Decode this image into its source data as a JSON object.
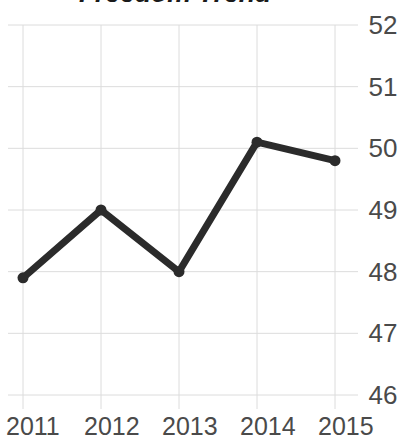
{
  "chart_data": {
    "type": "line",
    "title": "Freedom Trend",
    "xlabel": "",
    "ylabel": "",
    "categories": [
      "2011",
      "2012",
      "2013",
      "2014",
      "2015"
    ],
    "values": [
      47.9,
      49.0,
      48.0,
      50.1,
      49.8
    ],
    "series": [
      {
        "name": "Freedom",
        "values": [
          47.9,
          49.0,
          48.0,
          50.1,
          49.8
        ]
      }
    ],
    "ylim": [
      46,
      52
    ],
    "xlim": [
      "2011",
      "2015"
    ],
    "y_ticks": [
      "52",
      "51",
      "50",
      "49",
      "48",
      "47",
      "46"
    ],
    "y_tick_values": [
      52,
      51,
      50,
      49,
      48,
      47,
      46
    ],
    "x_ticks": [
      "2011",
      "2012",
      "2013",
      "2014",
      "2015"
    ],
    "grid": true,
    "legend": false,
    "legend_position": "none",
    "marker": "circle",
    "line_color": "#2b2b2b",
    "marker_color": "#2b2b2b",
    "grid_color": "#dcdcdc",
    "tick_label_color": "#4a4a4a",
    "title_color": "#1a1a1a",
    "background_color": "#ffffff"
  }
}
